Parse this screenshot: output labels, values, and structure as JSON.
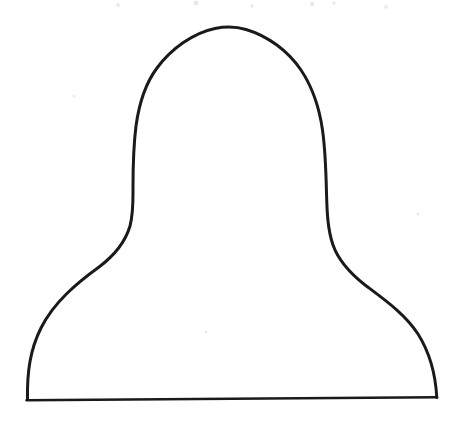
{
  "figure": {
    "title": "Hand-drawn bell / mushroom outline",
    "medium": "pen-and-ink line drawing, scanned",
    "canvas": {
      "width": 463,
      "height": 427,
      "background_color": "#ffffff"
    },
    "ink": {
      "color": "#1a1a1a",
      "outline_stroke_width": 3.0,
      "baseline_stroke_width": 2.6
    },
    "geometry": {
      "apex": {
        "x": 228,
        "y": 27
      },
      "left_waist": {
        "x": 132,
        "y": 210
      },
      "right_waist": {
        "x": 327,
        "y": 205
      },
      "left_foot": {
        "x": 27,
        "y": 400
      },
      "right_foot": {
        "x": 437,
        "y": 397
      },
      "baseline_y": 399,
      "dome_width": 196,
      "skirt_width": 410,
      "total_height": 373
    },
    "paths": {
      "outline": "M 27.5 399.5 C 27.0 372.0 30.0 350.0 41.0 328.0 C 54.0 302.0 77.0 283.0 99.0 267.0 C 115.0 255.0 125.0 243.0 130.0 226.0 C 133.5 213.0 133.0 200.0 133.0 187.0 C 133.0 166.0 133.5 146.0 136.0 126.0 C 139.0 104.0 145.0 84.0 157.0 68.0 C 171.0 49.0 193.0 33.0 215.0 28.5 C 225.0 26.5 236.0 26.5 246.0 29.5 C 268.0 36.0 288.0 51.0 301.0 70.0 C 313.0 88.0 319.5 109.0 322.5 130.0 C 325.5 151.0 326.0 172.0 326.5 193.0 C 327.0 211.0 327.5 229.0 333.0 245.0 C 339.0 262.0 351.0 274.0 365.0 285.0 C 385.0 300.0 405.0 314.0 418.0 334.0 C 430.0 353.0 435.5 374.0 436.8 397.5",
      "baseline": "M 26.5 400.2 L 437.0 397.2"
    },
    "specks": [
      {
        "x": 118,
        "y": 5,
        "r": 2.0
      },
      {
        "x": 196,
        "y": 3,
        "r": 2.4
      },
      {
        "x": 252,
        "y": 6,
        "r": 1.8
      },
      {
        "x": 312,
        "y": 4,
        "r": 2.2
      },
      {
        "x": 334,
        "y": 3,
        "r": 1.6
      },
      {
        "x": 386,
        "y": 7,
        "r": 1.9
      },
      {
        "x": 74,
        "y": 96,
        "r": 1.5
      },
      {
        "x": 418,
        "y": 214,
        "r": 1.4
      },
      {
        "x": 206,
        "y": 332,
        "r": 1.3
      }
    ]
  }
}
